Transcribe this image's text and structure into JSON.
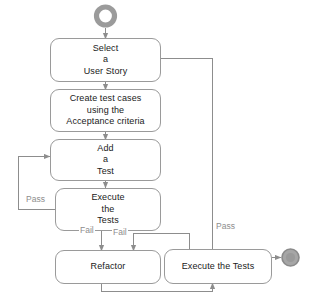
{
  "diagram": {
    "type": "uml-activity-diagram",
    "colors": {
      "node_border": "#9a9a9a",
      "node_fill": "#ffffff",
      "edge": "#8d8d8d",
      "label_text": "#8d8d8d",
      "node_text": "#1a1a1a",
      "start_node": "#9b9b9b",
      "end_node": "#9b9b9b"
    },
    "nodes": [
      {
        "id": "start",
        "name": "start-node",
        "shape": "initial-circle",
        "label": ""
      },
      {
        "id": "select_story",
        "name": "select-a-user-story",
        "shape": "rounded-rect",
        "lines": [
          "Select",
          "a",
          "User Story"
        ]
      },
      {
        "id": "create_tests",
        "name": "create-test-cases",
        "shape": "rounded-rect",
        "lines": [
          "Create test cases",
          "using the",
          "Acceptance criteria"
        ]
      },
      {
        "id": "add_test",
        "name": "add-a-test",
        "shape": "rounded-rect",
        "lines": [
          "Add",
          "a",
          "Test"
        ]
      },
      {
        "id": "execute_tests",
        "name": "execute-the-tests",
        "shape": "rounded-rect",
        "lines": [
          "Execute",
          "the",
          "Tests"
        ]
      },
      {
        "id": "refactor",
        "name": "refactor",
        "shape": "rounded-rect",
        "lines": [
          "Refactor"
        ]
      },
      {
        "id": "execute_tests_2",
        "name": "execute-the-tests-final",
        "shape": "rounded-rect",
        "lines": [
          "Execute the Tests"
        ]
      },
      {
        "id": "end",
        "name": "end-node",
        "shape": "final-circle",
        "label": ""
      }
    ],
    "edges": [
      {
        "from": "start",
        "to": "select_story",
        "label": ""
      },
      {
        "from": "select_story",
        "to": "create_tests",
        "label": ""
      },
      {
        "from": "create_tests",
        "to": "add_test",
        "label": ""
      },
      {
        "from": "add_test",
        "to": "execute_tests",
        "label": ""
      },
      {
        "from": "execute_tests",
        "to": "add_test",
        "label": "Pass"
      },
      {
        "from": "execute_tests",
        "to": "refactor",
        "label": "Fail"
      },
      {
        "from": "execute_tests_2",
        "to": "refactor",
        "label": "Fail"
      },
      {
        "from": "refactor",
        "to": "execute_tests_2",
        "label": ""
      },
      {
        "from": "execute_tests_2",
        "to": "select_story",
        "label": "Pass"
      },
      {
        "from": "execute_tests_2",
        "to": "end",
        "label": ""
      }
    ],
    "labels": {
      "pass_left": "Pass",
      "fail_left": "Fail",
      "fail_right": "Fail",
      "pass_right": "Pass"
    }
  }
}
